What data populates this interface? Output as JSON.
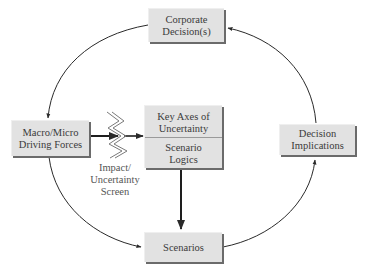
{
  "diagram": {
    "type": "scenario-planning-cycle",
    "nodes": {
      "corporate_decisions": {
        "line1": "Corporate",
        "line2": "Decision(s)"
      },
      "driving_forces": {
        "line1": "Macro/Micro",
        "line2": "Driving Forces"
      },
      "key_axes": {
        "line1": "Key Axes of",
        "line2": "Uncertainty"
      },
      "scenario_logics": {
        "line1": "Scenario",
        "line2": "Logics"
      },
      "decision_implications": {
        "line1": "Decision",
        "line2": "Implications"
      },
      "scenarios": {
        "label": "Scenarios"
      }
    },
    "screen": {
      "line1": "Impact/",
      "line2": "Uncertainty",
      "line3": "Screen"
    },
    "edges": [
      {
        "from": "Corporate Decision(s)",
        "to": "Macro/Micro Driving Forces",
        "style": "curved-arrow"
      },
      {
        "from": "Macro/Micro Driving Forces",
        "to": "Key Axes of Uncertainty",
        "via": "Impact/Uncertainty Screen",
        "style": "straight-arrow"
      },
      {
        "from": "Scenario Logics",
        "to": "Scenarios",
        "style": "straight-arrow"
      },
      {
        "from": "Macro/Micro Driving Forces",
        "to": "Scenarios",
        "style": "curved-arrow"
      },
      {
        "from": "Scenarios",
        "to": "Decision Implications",
        "style": "curved-arrow"
      },
      {
        "from": "Decision Implications",
        "to": "Corporate Decision(s)",
        "style": "curved-arrow"
      }
    ],
    "colors": {
      "box_fill": "#e2e2e2",
      "box_shadow": "#6b6b6b",
      "line": "#2a2a2a",
      "screen_stroke": "#7a7a7a",
      "text": "#3a3a3a"
    }
  }
}
